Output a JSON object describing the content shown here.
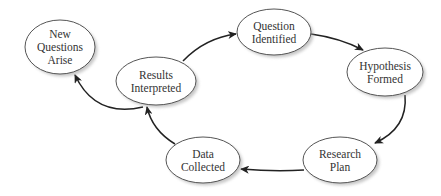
{
  "diagram": {
    "type": "cycle-flowchart",
    "colors": {
      "node_fill": "#ffffff",
      "node_stroke": "#555555",
      "node_shadow": "#9a9a9a",
      "text": "#333333",
      "edge": "#222222",
      "background": "#ffffff"
    },
    "nodes": [
      {
        "id": "question",
        "lines": [
          "Question",
          "Identified"
        ],
        "cx": 274,
        "cy": 32,
        "rx": 37,
        "ry": 23
      },
      {
        "id": "hypothesis",
        "lines": [
          "Hypothesis",
          "Formed"
        ],
        "cx": 385,
        "cy": 72,
        "rx": 38,
        "ry": 24
      },
      {
        "id": "research",
        "lines": [
          "Research",
          "Plan"
        ],
        "cx": 340,
        "cy": 160,
        "rx": 37,
        "ry": 23
      },
      {
        "id": "data",
        "lines": [
          "Data",
          "Collected"
        ],
        "cx": 203,
        "cy": 160,
        "rx": 37,
        "ry": 23
      },
      {
        "id": "results",
        "lines": [
          "Results",
          "Interpreted"
        ],
        "cx": 156,
        "cy": 81,
        "rx": 40,
        "ry": 24
      },
      {
        "id": "newq",
        "lines": [
          "New",
          "Questions",
          "Arise"
        ],
        "cx": 60,
        "cy": 47,
        "rx": 35,
        "ry": 27
      }
    ],
    "edges": [
      {
        "from": "results",
        "to": "question",
        "d": "M 183 61 Q 205 38 236 34"
      },
      {
        "from": "question",
        "to": "hypothesis",
        "d": "M 311 34 Q 340 38 363 50"
      },
      {
        "from": "hypothesis",
        "to": "research",
        "d": "M 405 95 Q 408 128 375 143"
      },
      {
        "from": "research",
        "to": "data",
        "d": "M 304 170 Q 275 172 241 169"
      },
      {
        "from": "data",
        "to": "results",
        "d": "M 175 144 Q 152 130 147 107"
      },
      {
        "from": "results",
        "to": "newq",
        "d": "M 143 107 Q 95 118 75 75"
      }
    ]
  }
}
